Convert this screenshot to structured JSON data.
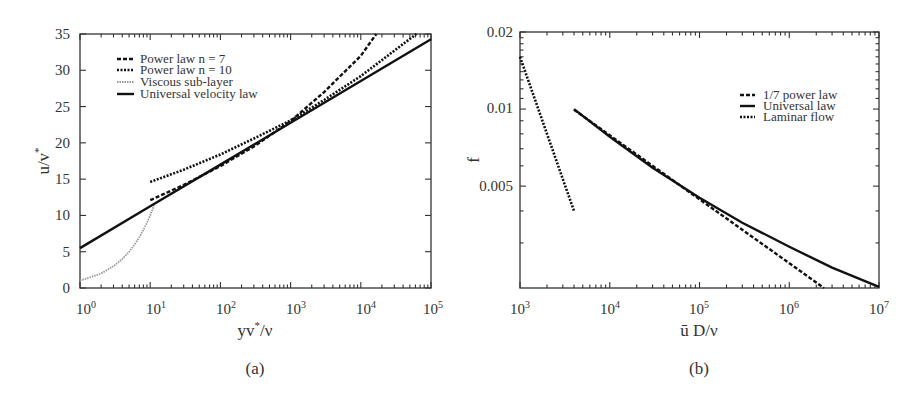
{
  "figure": {
    "panels": [
      "(a)",
      "(b)"
    ]
  },
  "chart_data": [
    {
      "type": "line",
      "caption": "(a)",
      "title": "",
      "xlabel": "yv*/ν",
      "ylabel": "u/v*",
      "xscale": "log",
      "xlim": [
        1,
        100000
      ],
      "ylim": [
        0,
        35
      ],
      "x_ticks": [
        "10^0",
        "10^1",
        "10^2",
        "10^3",
        "10^4",
        "10^5"
      ],
      "y_ticks": [
        "0",
        "5",
        "10",
        "15",
        "20",
        "25",
        "30",
        "35"
      ],
      "grid": false,
      "legend_position": "upper left",
      "series": [
        {
          "name": "Power law n = 7",
          "style": "dashed",
          "x": [
            10,
            30,
            100,
            300,
            1000,
            3000,
            10000,
            16600
          ],
          "y": [
            12.1,
            14.2,
            16.8,
            19.5,
            23.0,
            27.0,
            32.0,
            35.0
          ]
        },
        {
          "name": "Power law n = 10",
          "style": "dotted",
          "x": [
            10,
            30,
            100,
            300,
            1000,
            3000,
            10000,
            30000,
            62000
          ],
          "y": [
            14.6,
            16.3,
            18.4,
            20.6,
            23.1,
            25.9,
            29.2,
            32.7,
            35.0
          ]
        },
        {
          "name": "Viscous sub-layer",
          "style": "dotted-gray",
          "x": [
            1,
            2,
            3,
            4,
            5,
            6,
            7,
            8,
            9,
            10,
            11.4
          ],
          "y": [
            1,
            2,
            3,
            4,
            5,
            6,
            7,
            8,
            9,
            10,
            11.4
          ]
        },
        {
          "name": "Universal velocity law",
          "style": "solid",
          "x": [
            1,
            10,
            100,
            1000,
            10000,
            100000
          ],
          "y": [
            5.5,
            11.26,
            17.01,
            22.77,
            28.53,
            34.28
          ]
        }
      ]
    },
    {
      "type": "line",
      "caption": "(b)",
      "title": "",
      "xlabel": "ū D/ν",
      "ylabel": "f",
      "xscale": "log",
      "yscale": "log",
      "xlim": [
        1000,
        10000000
      ],
      "ylim": [
        0.002,
        0.02
      ],
      "x_ticks": [
        "10^3",
        "10^4",
        "10^5",
        "10^6",
        "10^7"
      ],
      "y_ticks": [
        "0.005",
        "0.01",
        "0.02"
      ],
      "grid": false,
      "legend_position": "upper right",
      "series": [
        {
          "name": "1/7 power law",
          "style": "dashed",
          "x": [
            4000,
            10000,
            100000,
            1000000,
            2430000
          ],
          "y": [
            0.00993,
            0.0079,
            0.00444,
            0.0025,
            0.002
          ]
        },
        {
          "name": "Universal law",
          "style": "solid",
          "x": [
            4000,
            10000,
            30000,
            100000,
            300000,
            1000000,
            3000000,
            10000000
          ],
          "y": [
            0.01,
            0.0078,
            0.0059,
            0.0045,
            0.0036,
            0.0029,
            0.0024,
            0.00202
          ]
        },
        {
          "name": "Laminar flow",
          "style": "dotted",
          "x": [
            1000,
            2000,
            3000,
            4000
          ],
          "y": [
            0.016,
            0.008,
            0.00533,
            0.004
          ]
        }
      ]
    }
  ],
  "legend_a": [
    "Power law n = 7",
    "Power law n = 10",
    "Viscous sub-layer",
    "Universal velocity law"
  ],
  "legend_b": [
    "1/7 power law",
    "Universal law",
    "Laminar flow"
  ],
  "labels": {
    "a": {
      "ylabel_main": "u/v",
      "ylabel_sup": "*",
      "xlabel_pre": "yv",
      "xlabel_sup": "*",
      "xlabel_post": "/ν",
      "caption": "(a)",
      "yticks": [
        "0",
        "5",
        "10",
        "15",
        "20",
        "25",
        "30",
        "35"
      ],
      "xticks": [
        {
          "b": "10",
          "e": "0"
        },
        {
          "b": "10",
          "e": "1"
        },
        {
          "b": "10",
          "e": "2"
        },
        {
          "b": "10",
          "e": "3"
        },
        {
          "b": "10",
          "e": "4"
        },
        {
          "b": "10",
          "e": "5"
        }
      ]
    },
    "b": {
      "ylabel": "f",
      "xlabel": "ū D/ν",
      "caption": "(b)",
      "yticks": [
        "0.02",
        "0.01",
        "0.005"
      ],
      "xticks": [
        {
          "b": "10",
          "e": "3"
        },
        {
          "b": "10",
          "e": "4"
        },
        {
          "b": "10",
          "e": "5"
        },
        {
          "b": "10",
          "e": "6"
        },
        {
          "b": "10",
          "e": "7"
        }
      ]
    }
  }
}
